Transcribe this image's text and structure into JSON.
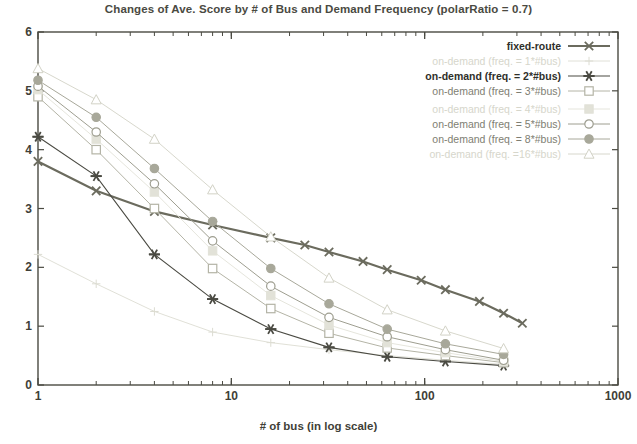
{
  "chart_data": {
    "type": "line",
    "title": "Changes of Ave. Score by # of Bus and Demand Frequency (polarRatio = 0.7)",
    "xlabel": "# of bus (in log scale)",
    "ylabel": "Average Time to Complete a Demand",
    "xscale": "log",
    "xlim": [
      1,
      1000
    ],
    "ylim": [
      0,
      6
    ],
    "xticks": [
      1,
      10,
      100,
      1000
    ],
    "xtick_labels": [
      "1",
      "10",
      "100",
      "1000"
    ],
    "yticks": [
      0,
      1,
      2,
      3,
      4,
      5,
      6
    ],
    "ytick_labels": [
      "0",
      "1",
      "2",
      "3",
      "4",
      "5",
      "6"
    ],
    "grid": false,
    "legend_position": "top-right",
    "x": [
      1,
      2,
      4,
      8,
      16,
      32,
      64,
      128,
      256
    ],
    "series": [
      {
        "name": "fixed-route",
        "marker": "cross-x",
        "color": "#6b6b5e",
        "emphasis": "strong",
        "x": [
          1,
          2,
          4,
          8,
          16,
          24,
          32,
          48,
          64,
          96,
          128,
          192,
          256,
          320
        ],
        "values": [
          3.8,
          3.3,
          2.95,
          2.72,
          2.5,
          2.38,
          2.26,
          2.1,
          1.96,
          1.78,
          1.62,
          1.42,
          1.22,
          1.05
        ]
      },
      {
        "name": "on-demand (freq. = 1*#bus)",
        "marker": "plus",
        "color": "#dcdcd2",
        "emphasis": "faint",
        "x": [
          1,
          2,
          4,
          8,
          16,
          32,
          64,
          128,
          256
        ],
        "values": [
          2.22,
          1.72,
          1.25,
          0.9,
          0.72,
          0.6,
          0.5,
          0.42,
          0.35
        ]
      },
      {
        "name": "on-demand (freq. = 2*#bus)",
        "marker": "star",
        "color": "#4a4a42",
        "emphasis": "strong",
        "x": [
          1,
          2,
          4,
          8,
          16,
          32,
          64,
          128,
          256
        ],
        "values": [
          4.22,
          3.55,
          2.22,
          1.46,
          0.95,
          0.64,
          0.48,
          0.4,
          0.33
        ]
      },
      {
        "name": "on-demand (freq. = 3*#bus)",
        "marker": "open-square",
        "color": "#b4b4a6",
        "emphasis": "medium",
        "x": [
          1,
          2,
          4,
          8,
          16,
          32,
          64,
          128,
          256
        ],
        "values": [
          4.9,
          4.0,
          3.0,
          1.98,
          1.3,
          0.88,
          0.63,
          0.5,
          0.38
        ]
      },
      {
        "name": "on-demand (freq. = 4*#bus)",
        "marker": "filled-square",
        "color": "#e2e2d8",
        "emphasis": "faint",
        "x": [
          1,
          2,
          4,
          8,
          16,
          32,
          64,
          128,
          256
        ],
        "values": [
          5.02,
          4.18,
          3.28,
          2.28,
          1.52,
          1.02,
          0.72,
          0.55,
          0.4
        ]
      },
      {
        "name": "on-demand (freq. = 5*#bus)",
        "marker": "open-circle",
        "color": "#9e9e90",
        "emphasis": "medium",
        "x": [
          1,
          2,
          4,
          8,
          16,
          32,
          64,
          128,
          256
        ],
        "values": [
          5.08,
          4.3,
          3.42,
          2.45,
          1.68,
          1.15,
          0.82,
          0.6,
          0.42
        ]
      },
      {
        "name": "on-demand (freq. = 8*#bus)",
        "marker": "filled-circle",
        "color": "#a8a89a",
        "emphasis": "medium",
        "x": [
          1,
          2,
          4,
          8,
          16,
          32,
          64,
          128,
          256
        ],
        "values": [
          5.18,
          4.55,
          3.68,
          2.78,
          1.98,
          1.38,
          0.95,
          0.7,
          0.52
        ]
      },
      {
        "name": "on-demand (freq. =16*#bus)",
        "marker": "open-triangle",
        "color": "#d2d2c6",
        "emphasis": "faint",
        "x": [
          1,
          2,
          4,
          8,
          16,
          32,
          64,
          128,
          256
        ],
        "values": [
          5.38,
          4.85,
          4.18,
          3.32,
          2.52,
          1.82,
          1.28,
          0.92,
          0.62
        ]
      }
    ]
  },
  "legend": {
    "entries": [
      {
        "label": "fixed-route",
        "marker": "cross-x"
      },
      {
        "label": "on-demand (freq. = 1*#bus)",
        "marker": "plus"
      },
      {
        "label": "on-demand (freq. = 2*#bus)",
        "marker": "star"
      },
      {
        "label": "on-demand (freq. = 3*#bus)",
        "marker": "open-square"
      },
      {
        "label": "on-demand (freq. = 4*#bus)",
        "marker": "filled-square"
      },
      {
        "label": "on-demand (freq. = 5*#bus)",
        "marker": "open-circle"
      },
      {
        "label": "on-demand (freq. = 8*#bus)",
        "marker": "filled-circle"
      },
      {
        "label": "on-demand (freq. =16*#bus)",
        "marker": "open-triangle"
      }
    ]
  },
  "axes": {
    "frame_color": "#4a4a42",
    "background": "#ffffff"
  }
}
